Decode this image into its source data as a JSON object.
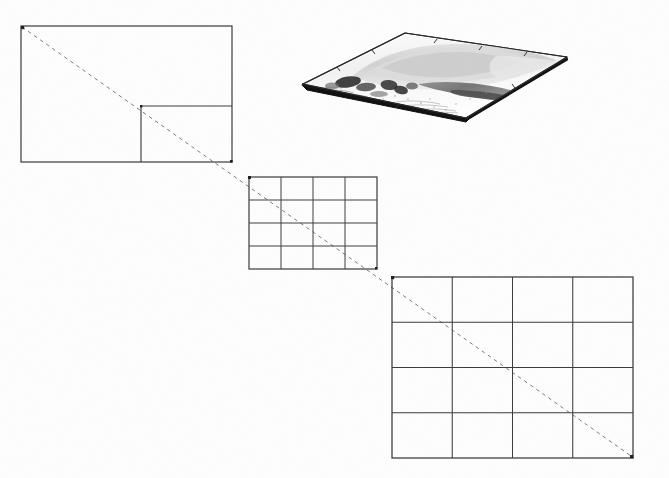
{
  "figure": {
    "domain": "Diagram",
    "title": "Nested multi-resolution grid cascade with terrain surface",
    "background_color": "#fefefe",
    "ink_color": "#1a1a1a",
    "grid_line_color": "#3a3a3a",
    "dashed_line_color": "#6b6b6b",
    "canvas": {
      "width": 669,
      "height": 478
    }
  },
  "diagonal": {
    "name": "reference-diagonal",
    "style": "dashed",
    "dash_pattern": "4 4",
    "stroke_width": 1,
    "color": "#7a7a7a",
    "start": {
      "x": 22,
      "y": 27
    },
    "end": {
      "x": 634,
      "y": 458
    }
  },
  "panels": [
    {
      "id": "panel-coarse",
      "label": "coarse-grid-panel",
      "position": "top-left",
      "x": 21,
      "y": 26,
      "width": 211,
      "height": 136,
      "columns": 1,
      "rows": 1,
      "cell_count": 1,
      "inner_cell": {
        "name": "highlighted-subcell",
        "x": 141,
        "y": 106,
        "width": 91,
        "height": 56
      }
    },
    {
      "id": "panel-medium",
      "label": "medium-grid-panel",
      "position": "center",
      "x": 249,
      "y": 177,
      "width": 128,
      "height": 92,
      "columns": 4,
      "rows": 4,
      "cell_count": 16
    },
    {
      "id": "panel-fine",
      "label": "fine-grid-panel",
      "position": "bottom-right",
      "x": 392,
      "y": 277,
      "width": 241,
      "height": 181,
      "columns": 4,
      "rows": 4,
      "cell_count": 16
    }
  ],
  "terrain": {
    "name": "terrain-surface-sheet",
    "position": "top-right",
    "bounds": {
      "x": 300,
      "y": 30,
      "width": 270,
      "height": 95
    },
    "corners": {
      "left": {
        "x": 303,
        "y": 84
      },
      "top": {
        "x": 405,
        "y": 33
      },
      "right": {
        "x": 567,
        "y": 57
      },
      "bottom": {
        "x": 466,
        "y": 118
      }
    },
    "shadow_edge_color": "#111111",
    "outline_color": "#2a2a2a",
    "shading": {
      "light_gray": "#d8d8d8",
      "mid_gray": "#9a9a9a",
      "dark_gray": "#565656",
      "darkest": "#2b2b2b"
    },
    "tick_marks": 6
  }
}
